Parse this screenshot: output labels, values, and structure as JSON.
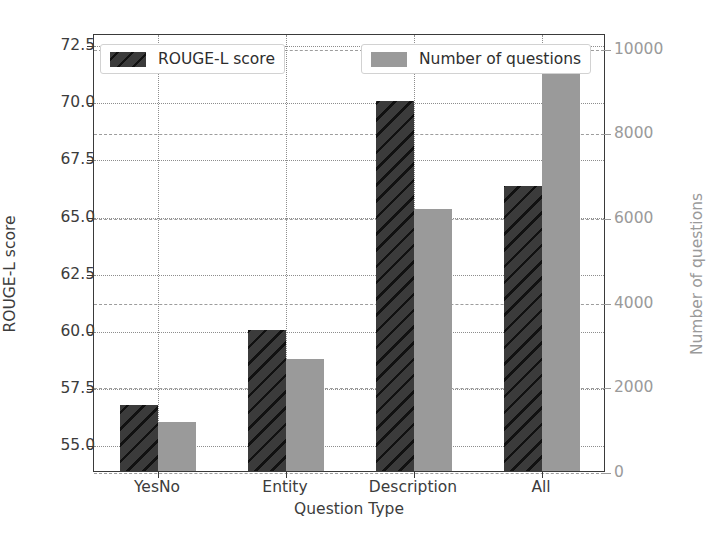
{
  "chart_data": {
    "type": "bar",
    "title": "",
    "xlabel": "Question Type",
    "ylabel": "ROUGE-L score",
    "y2label": "Number of questions",
    "categories": [
      "YesNo",
      "Entity",
      "Description",
      "All"
    ],
    "grid": true,
    "legend_position": "upper center (two boxes, left and right)",
    "series": [
      {
        "name": "ROUGE-L score",
        "axis": "left",
        "color": "#3b3b3b",
        "hatch": "diagonal",
        "values": [
          56.7,
          60.0,
          70.0,
          66.3
        ]
      },
      {
        "name": "Number of questions",
        "axis": "right",
        "color": "#9a9a9a",
        "hatch": "none",
        "values": [
          1150,
          2650,
          6200,
          9630
        ]
      }
    ],
    "ylim": [
      53.8,
      73.0
    ],
    "y2lim": [
      0,
      10350
    ],
    "yticks": [
      "55.0",
      "57.5",
      "60.0",
      "62.5",
      "65.0",
      "67.5",
      "70.0",
      "72.5"
    ],
    "ytick_values": [
      55.0,
      57.5,
      60.0,
      62.5,
      65.0,
      67.5,
      70.0,
      72.5
    ],
    "y2ticks": [
      "0",
      "2000",
      "4000",
      "6000",
      "8000",
      "10000"
    ],
    "y2tick_values": [
      0,
      2000,
      4000,
      6000,
      8000,
      10000
    ]
  },
  "legend": {
    "left": {
      "label": "ROUGE-L score",
      "swatch": "dark-hatched-swatch"
    },
    "right": {
      "label": "Number of questions",
      "swatch": "gray-swatch"
    }
  },
  "colors": {
    "rouge_bar": "#3b3b3b",
    "questions_bar": "#9a9a9a",
    "axis": "#3a3a3a",
    "right_axis": "#9a9a9a",
    "grid": "#8d8d8d",
    "background": "#ffffff"
  }
}
